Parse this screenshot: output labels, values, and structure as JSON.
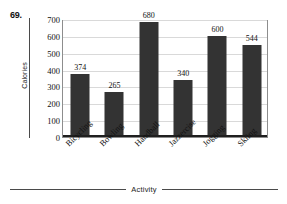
{
  "problem": {
    "number": "69."
  },
  "chart_data": {
    "type": "bar",
    "title": "",
    "xlabel": "Activity",
    "ylabel": "Calories",
    "categories": [
      "Bicycling",
      "Bowling",
      "Handball",
      "Jazzercise",
      "Jogging",
      "Skiing"
    ],
    "values": [
      374,
      265,
      680,
      340,
      600,
      544
    ],
    "value_labels": [
      "374",
      "265",
      "680",
      "340",
      "600",
      "544"
    ],
    "ylim": [
      0,
      700
    ],
    "ytick_labels": [
      "700",
      "600",
      "500",
      "400",
      "300",
      "200",
      "100",
      "0"
    ],
    "ytick_values": [
      700,
      600,
      500,
      400,
      300,
      200,
      100,
      0
    ],
    "grid": true,
    "legend": "none",
    "bar_color": "#333333",
    "grid_color": "#d9d9d9",
    "axis_color": "#1f1f1f"
  }
}
